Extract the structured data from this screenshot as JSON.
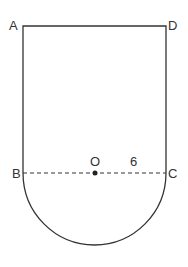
{
  "diagram": {
    "points": {
      "A": {
        "label": "A",
        "x": 23,
        "y": 26
      },
      "D": {
        "label": "D",
        "x": 166,
        "y": 26
      },
      "B": {
        "label": "B",
        "x": 23,
        "y": 173
      },
      "C": {
        "label": "C",
        "x": 166,
        "y": 173
      },
      "O": {
        "label": "O",
        "x": 95,
        "y": 173
      }
    },
    "radius_label": "6",
    "colors": {
      "stroke": "#333333",
      "background": "#ffffff"
    }
  }
}
